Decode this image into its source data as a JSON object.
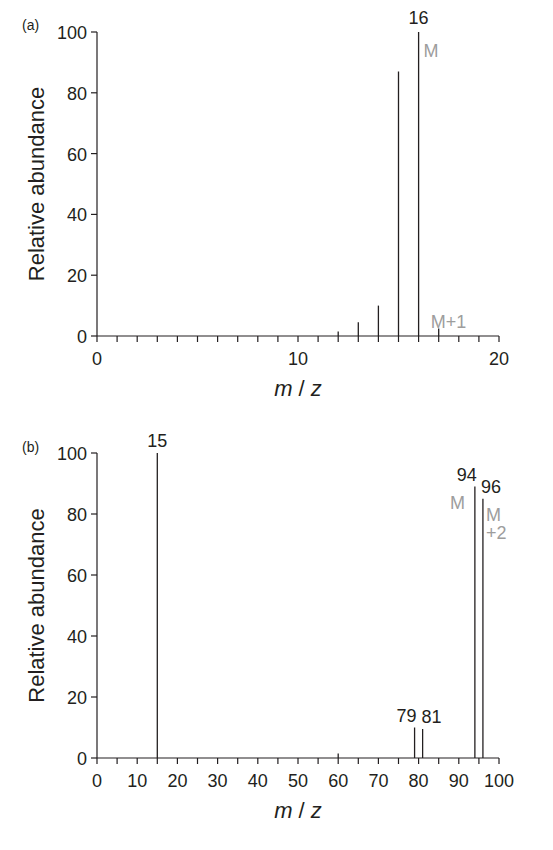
{
  "chart_data": [
    {
      "type": "bar",
      "subtype": "mass-spectrum-stick",
      "panel_label": "(a)",
      "xlabel_parts": [
        "m",
        " / ",
        "z"
      ],
      "ylabel": "Relative abundance",
      "xlim": [
        0,
        20
      ],
      "ylim": [
        0,
        100
      ],
      "x_ticks": [
        0,
        10,
        20
      ],
      "x_minor_step": 1,
      "y_ticks": [
        0,
        20,
        40,
        60,
        80,
        100
      ],
      "grid": false,
      "peaks": [
        {
          "x": 12,
          "y": 1.5
        },
        {
          "x": 13,
          "y": 4.5
        },
        {
          "x": 14,
          "y": 10
        },
        {
          "x": 15,
          "y": 87
        },
        {
          "x": 16,
          "y": 100
        },
        {
          "x": 17,
          "y": 2.5
        }
      ],
      "peak_labels": [
        {
          "x": 16,
          "text": "16"
        }
      ],
      "annotations": [
        {
          "text": "M",
          "x": 16,
          "y": 94,
          "color": "#9d9d9d"
        },
        {
          "text": "M+1",
          "x": 17,
          "y": 5,
          "color": "#9d9d9d"
        }
      ]
    },
    {
      "type": "bar",
      "subtype": "mass-spectrum-stick",
      "panel_label": "(b)",
      "xlabel_parts": [
        "m",
        " / ",
        "z"
      ],
      "ylabel": "Relative abundance",
      "xlim": [
        0,
        100
      ],
      "ylim": [
        0,
        100
      ],
      "x_ticks": [
        0,
        10,
        20,
        30,
        40,
        50,
        60,
        70,
        80,
        90,
        100
      ],
      "x_minor_step": 5,
      "y_ticks": [
        0,
        20,
        40,
        60,
        80,
        100
      ],
      "grid": false,
      "peaks": [
        {
          "x": 15,
          "y": 100
        },
        {
          "x": 60,
          "y": 1.5
        },
        {
          "x": 79,
          "y": 10
        },
        {
          "x": 81,
          "y": 9.5
        },
        {
          "x": 94,
          "y": 89
        },
        {
          "x": 96,
          "y": 85
        }
      ],
      "peak_labels": [
        {
          "x": 15,
          "text": "15"
        },
        {
          "x": 79,
          "text": "79"
        },
        {
          "x": 81,
          "text": "81"
        },
        {
          "x": 94,
          "text": "94"
        },
        {
          "x": 96,
          "text": "96"
        }
      ],
      "annotations": [
        {
          "text": "M",
          "x": 94,
          "y": 84,
          "color": "#9d9d9d"
        },
        {
          "text": "M",
          "x": 96,
          "y": 80,
          "color": "#9d9d9d"
        },
        {
          "text": "+2",
          "x": 96,
          "y": 74,
          "color": "#9d9d9d"
        }
      ]
    }
  ]
}
